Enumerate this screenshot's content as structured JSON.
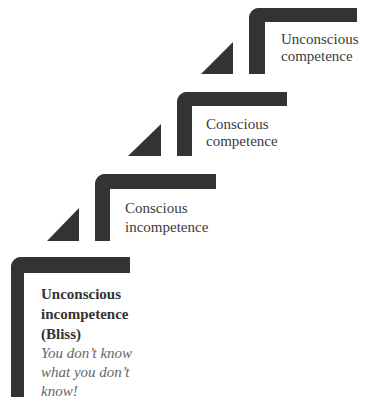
{
  "diagram": {
    "type": "staircase",
    "bar_color": "#333333",
    "text_color": "#3b3b3b",
    "note_color": "#666666",
    "steps": [
      {
        "level": 1,
        "title_lines": [
          "Unconscious",
          "incompetence",
          "(Bliss)"
        ],
        "note_lines": [
          "You don’t know",
          "what you don’t",
          "know!"
        ]
      },
      {
        "level": 2,
        "title_lines": [
          "Conscious",
          "incompetence"
        ]
      },
      {
        "level": 3,
        "title_lines": [
          "Conscious",
          "competence"
        ]
      },
      {
        "level": 4,
        "title_lines": [
          "Unconscious",
          "competence"
        ]
      }
    ]
  }
}
